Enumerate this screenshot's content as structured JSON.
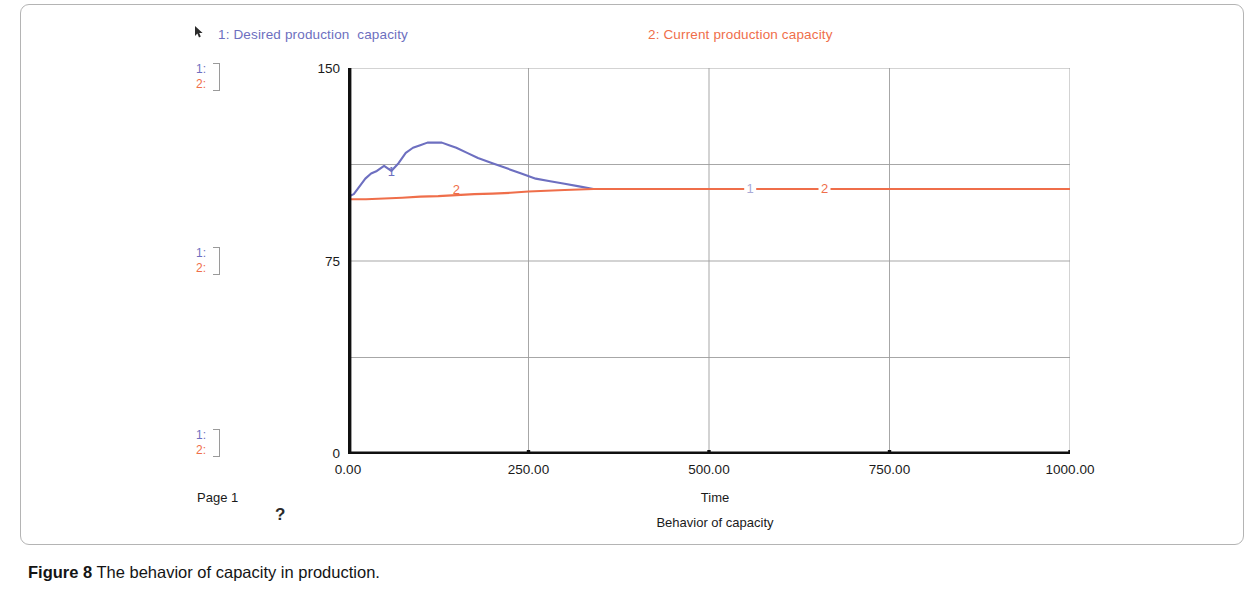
{
  "figure": {
    "caption_label": "Figure 8",
    "caption_text": " The behavior of capacity in production.",
    "page_label": "Page 1",
    "help_marker": "?"
  },
  "legend": {
    "entries": [
      {
        "key": "1",
        "label": "1: Desired production  capacity",
        "color": "#6d6fc0",
        "icon": "cursor-icon"
      },
      {
        "key": "2",
        "label": "2: Current production capacity",
        "color": "#ef6e4a",
        "icon": "none"
      }
    ]
  },
  "scale_brackets": [
    {
      "series_1": "1:",
      "series_2": "2:"
    },
    {
      "series_1": "1:",
      "series_2": "2:"
    },
    {
      "series_1": "1:",
      "series_2": "2:"
    }
  ],
  "chart_data": {
    "type": "line",
    "title": "Behavior of capacity",
    "xlabel": "Time",
    "ylabel": "",
    "xlim": [
      0,
      1000
    ],
    "ylim": [
      0,
      150
    ],
    "grid": true,
    "legend_position": "top",
    "xticks": [
      "0.00",
      "250.00",
      "500.00",
      "750.00",
      "1000.00"
    ],
    "xtick_values": [
      0,
      250,
      500,
      750,
      1000
    ],
    "yticks": [
      "150",
      "75",
      "0"
    ],
    "ytick_values": [
      150,
      75,
      0
    ],
    "y_gridlines": [
      0,
      37.5,
      75,
      112.5,
      150
    ],
    "x_gridlines": [
      250,
      500,
      750,
      1000
    ],
    "series": [
      {
        "name": "Desired production  capacity",
        "key": "1",
        "color": "#6d6fc0",
        "inline_label": "1",
        "inline_label_x": 60,
        "inline_label_y": 108,
        "x": [
          0,
          8,
          16,
          24,
          32,
          40,
          50,
          60,
          70,
          80,
          90,
          100,
          110,
          120,
          130,
          140,
          150,
          165,
          180,
          200,
          220,
          240,
          260,
          280,
          300,
          320,
          340,
          360,
          380,
          400
        ],
        "y": [
          100,
          101,
          104,
          107,
          109,
          110,
          112,
          110,
          113,
          117,
          119,
          120,
          121,
          121,
          121,
          120,
          119,
          117,
          115,
          113,
          111,
          109,
          107,
          106,
          105,
          104,
          103,
          103,
          103,
          103
        ]
      },
      {
        "name": "Current production capacity",
        "key": "2",
        "color": "#ef6e4a",
        "inline_label": "2",
        "inline_label_x": 150,
        "inline_label_y": 101,
        "x": [
          0,
          25,
          50,
          75,
          100,
          125,
          150,
          175,
          200,
          225,
          250,
          275,
          300,
          320,
          340,
          360,
          400,
          500,
          600,
          700,
          800,
          900,
          1000
        ],
        "y": [
          99,
          99,
          99.3,
          99.6,
          100,
          100.2,
          100.6,
          101,
          101.2,
          101.5,
          102,
          102.3,
          102.6,
          102.8,
          103,
          103,
          103,
          103,
          103,
          103,
          103,
          103,
          103
        ]
      }
    ],
    "inline_labels_far": [
      {
        "text": "1",
        "x": 557,
        "y": 103,
        "color": "#a9aad6"
      },
      {
        "text": "2",
        "x": 660,
        "y": 103,
        "color": "#ef6e4a"
      }
    ]
  }
}
